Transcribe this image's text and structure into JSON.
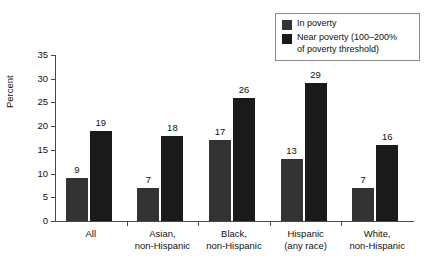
{
  "chart_data": {
    "type": "bar",
    "title": "",
    "xlabel": "",
    "ylabel": "Percent",
    "ylim": [
      0,
      35
    ],
    "ytick_values": [
      0,
      5,
      10,
      15,
      20,
      25,
      30,
      35
    ],
    "ytick_labels": [
      "0",
      "5",
      "10",
      "15",
      "20",
      "25",
      "30",
      "35"
    ],
    "grid": false,
    "legend_position": "top-right",
    "categories": [
      "All",
      "Asian,\nnon-Hispanic",
      "Black,\nnon-Hispanic",
      "Hispanic\n(any race)",
      "White,\nnon-Hispanic"
    ],
    "series": [
      {
        "name": "In poverty",
        "color": "#333333",
        "values": [
          9,
          7,
          17,
          13,
          7
        ],
        "labels": [
          "9",
          "7",
          "17",
          "13",
          "7"
        ]
      },
      {
        "name": "Near poverty (100–200%\nof poverty threshold)",
        "color": "#1a1a1a",
        "values": [
          19,
          18,
          26,
          29,
          16
        ],
        "labels": [
          "19",
          "18",
          "26",
          "29",
          "16"
        ]
      }
    ]
  },
  "legend": {
    "items": [
      {
        "label": "In poverty",
        "color": "#333333"
      },
      {
        "label": "Near poverty (100–200%\nof poverty threshold)",
        "color": "#1a1a1a"
      }
    ]
  },
  "axis": {
    "y_title": "Percent"
  },
  "colors": {
    "axis": "#4a4a4a",
    "text": "#111111",
    "legend_border": "#8a8a8a",
    "background": "#ffffff"
  }
}
